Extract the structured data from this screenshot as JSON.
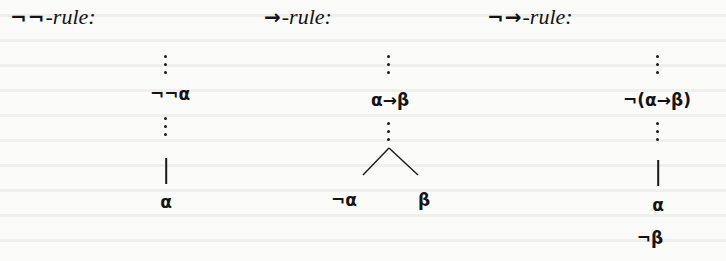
{
  "rules": [
    {
      "id": "double-negation",
      "title_symbol": "¬¬",
      "title_suffix": "-rule:",
      "premise": "¬¬α",
      "conclusions": [
        "α"
      ],
      "branching": false
    },
    {
      "id": "implication",
      "title_symbol": "→",
      "title_suffix": "-rule:",
      "premise": "α→β",
      "conclusions": [
        "¬α",
        "β"
      ],
      "branching": true
    },
    {
      "id": "negated-implication",
      "title_symbol": "¬→",
      "title_suffix": "-rule:",
      "premise": "¬(α→β)",
      "conclusions": [
        "α",
        "¬β"
      ],
      "branching": false
    }
  ],
  "colors": {
    "ink": "#141414",
    "paper": "#fbfbfa"
  }
}
